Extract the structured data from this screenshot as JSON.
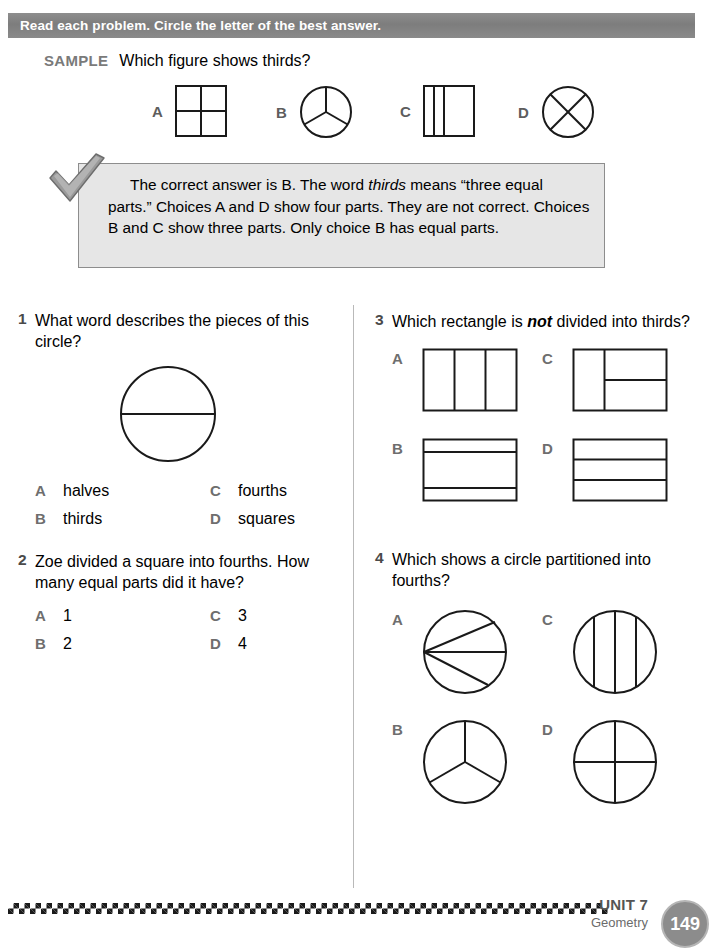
{
  "header": {
    "instruction": "Read each problem. Circle the letter of the best answer."
  },
  "sample": {
    "label": "SAMPLE",
    "question": "Which figure shows thirds?",
    "choices": [
      {
        "letter": "A",
        "figure": "square-divided-fourths"
      },
      {
        "letter": "B",
        "figure": "circle-divided-thirds"
      },
      {
        "letter": "C",
        "figure": "square-three-unequal-vertical-strips"
      },
      {
        "letter": "D",
        "figure": "circle-divided-fourths-diagonal"
      }
    ],
    "explanation_part1": "The correct answer is B. The word ",
    "explanation_italic": "thirds",
    "explanation_part2": " means “three equal parts.” Choices A and D show four parts. They are not correct. Choices B and C show three parts. Only choice B has equal parts."
  },
  "questions": [
    {
      "number": "1",
      "text": "What word describes the pieces of this circle?",
      "figure": "circle-split-in-half-horizontal",
      "options": [
        {
          "letter": "A",
          "value": "halves"
        },
        {
          "letter": "B",
          "value": "thirds"
        },
        {
          "letter": "C",
          "value": "fourths"
        },
        {
          "letter": "D",
          "value": "squares"
        }
      ]
    },
    {
      "number": "2",
      "text": "Zoe divided a square into fourths. How many equal parts did it have?",
      "options": [
        {
          "letter": "A",
          "value": "1"
        },
        {
          "letter": "B",
          "value": "2"
        },
        {
          "letter": "C",
          "value": "3"
        },
        {
          "letter": "D",
          "value": "4"
        }
      ]
    },
    {
      "number": "3",
      "text_before": "Which rectangle is ",
      "text_emphasis": "not",
      "text_after": " divided into thirds?",
      "options": [
        {
          "letter": "A",
          "figure": "rectangle-three-vertical-thirds"
        },
        {
          "letter": "B",
          "figure": "rectangle-three-unequal-horizontal-bands"
        },
        {
          "letter": "C",
          "figure": "rectangle-left-band-right-split-horizontal"
        },
        {
          "letter": "D",
          "figure": "rectangle-three-horizontal-thirds"
        }
      ]
    },
    {
      "number": "4",
      "text": "Which shows a circle partitioned into fourths?",
      "options": [
        {
          "letter": "A",
          "figure": "circle-three-chords-from-left-point"
        },
        {
          "letter": "B",
          "figure": "circle-divided-thirds-y-shape"
        },
        {
          "letter": "C",
          "figure": "circle-three-vertical-chords"
        },
        {
          "letter": "D",
          "figure": "circle-divided-fourths-cross"
        }
      ]
    }
  ],
  "footer": {
    "unit": "UNIT 7",
    "subject": "Geometry",
    "page_number": "149"
  },
  "icons": {
    "check": "checkmark-icon"
  },
  "colors": {
    "header_bar": "#7d7d7d",
    "callout_background": "#e6e6e6",
    "letter_gray": "#6e6e6e",
    "badge_gray": "#8c8c8c",
    "figure_stroke": "#1a1a1a"
  }
}
